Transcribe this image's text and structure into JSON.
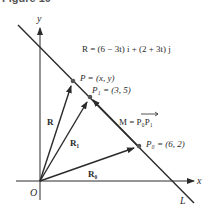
{
  "caption": "Figure 10",
  "axes": {
    "x_label": "x",
    "y_label": "y",
    "origin_label": "O"
  },
  "line_label": "L",
  "equation": "R = (6 − 3t) i + (2 + 3t) j",
  "points": {
    "P": "P = (x, y)",
    "P1": "P₁ = (3, 5)",
    "P0": "P₀ = (6, 2)"
  },
  "vectors": {
    "R": "R",
    "R1": "R₁",
    "R0": "R₀",
    "M": "M = P₀P₁"
  },
  "colors": {
    "ink": "#2a2a2a",
    "background": "#ffffff"
  }
}
